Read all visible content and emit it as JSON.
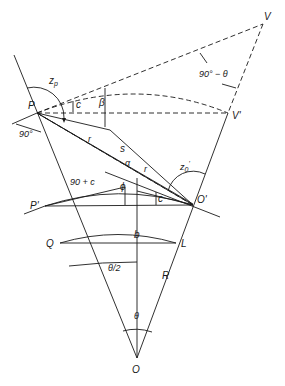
{
  "diagram": {
    "type": "geometric-construction",
    "points": {
      "V": "V",
      "V_prime": "V'",
      "P": "P",
      "P_prime": "P'",
      "O_prime": "O'",
      "O": "O",
      "Q": "Q",
      "L": "L"
    },
    "angle_labels": {
      "zp": "z",
      "zp_sub": "p",
      "z0": "z",
      "z0_sub": "0",
      "z0_sup": "'",
      "c_top": "c",
      "beta": "β",
      "ninety_deg": "90°",
      "r_upper": "r",
      "s": "s",
      "alpha": "α",
      "r_lower": "r",
      "ninety_plus_c": "90 + c",
      "phi": "ϕ",
      "c_lower": "c",
      "ninety_minus_theta": "90° − θ",
      "theta_half": "θ/2",
      "theta": "θ",
      "b": "b",
      "R": "R"
    }
  }
}
